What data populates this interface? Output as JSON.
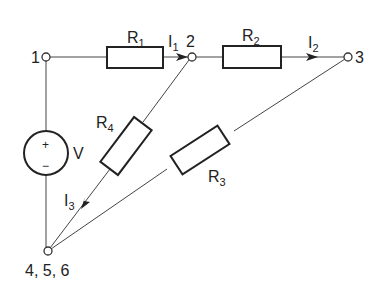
{
  "diagram": {
    "type": "circuit-schematic",
    "nodes": {
      "n1": {
        "label": "1"
      },
      "n2": {
        "label": "2"
      },
      "n3": {
        "label": "3"
      },
      "ground": {
        "label": "4, 5, 6"
      }
    },
    "source": {
      "label": "V",
      "plus": "+",
      "minus": "−"
    },
    "resistors": {
      "r1": {
        "main": "R",
        "sub": "1"
      },
      "r2": {
        "main": "R",
        "sub": "2"
      },
      "r3": {
        "main": "R",
        "sub": "3"
      },
      "r4": {
        "main": "R",
        "sub": "4"
      }
    },
    "currents": {
      "i1": {
        "main": "I",
        "sub": "1"
      },
      "i2": {
        "main": "I",
        "sub": "2"
      },
      "i3": {
        "main": "I",
        "sub": "3"
      }
    },
    "connections": [
      [
        "1",
        "R1",
        "2"
      ],
      [
        "2",
        "R2",
        "3"
      ],
      [
        "2",
        "R4",
        "4, 5, 6"
      ],
      [
        "3",
        "R3",
        "4, 5, 6"
      ],
      [
        "1",
        "V",
        "4, 5, 6"
      ]
    ]
  }
}
